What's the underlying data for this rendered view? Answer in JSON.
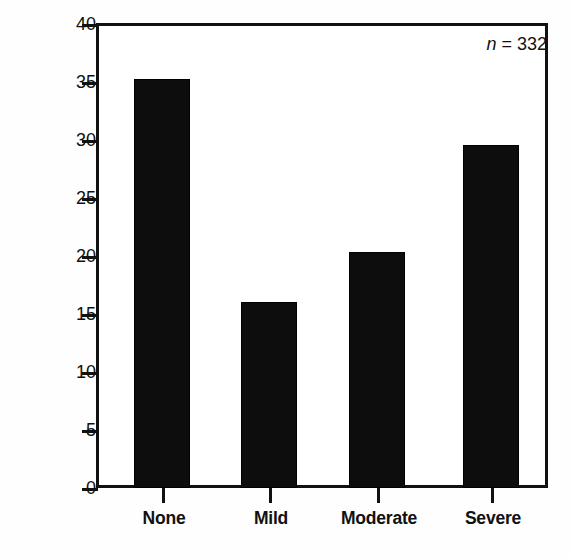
{
  "chart_data": {
    "type": "bar",
    "title": "",
    "subtitle": "",
    "xlabel": "",
    "ylabel": "Percent of total",
    "categories": [
      "None",
      "Mild",
      "Moderate",
      "Severe"
    ],
    "values": [
      35.2,
      16.0,
      20.3,
      29.5
    ],
    "series": [
      {
        "name": "Percent of total",
        "values": [
          35.2,
          16.0,
          20.3,
          29.5
        ]
      }
    ],
    "ylim": [
      0,
      40
    ],
    "ytick_values": [
      0,
      5,
      10,
      15,
      20,
      25,
      30,
      35,
      40
    ],
    "ytick_labels": [
      "0",
      "5",
      "10",
      "15",
      "20",
      "25",
      "30",
      "35",
      "40"
    ],
    "grid": false,
    "legend": false,
    "legend_position": "none",
    "bar_color": "#0d0d0d",
    "frame_color": "#111111",
    "background_color": "#ffffff",
    "annotations": [
      {
        "name": "sample-size",
        "italic_part": "n",
        "text": " = 332",
        "full_text": "n = 332",
        "position": "top-right"
      }
    ]
  }
}
